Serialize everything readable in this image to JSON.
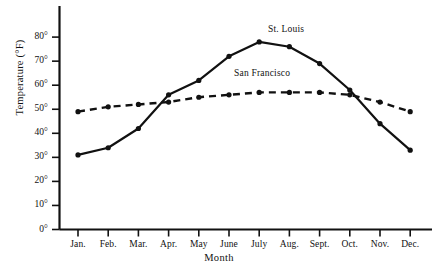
{
  "chart_data": {
    "type": "line",
    "title": "",
    "xlabel": "Month",
    "ylabel": "Temperature (°F)",
    "categories": [
      "Jan.",
      "Feb.",
      "Mar.",
      "Apr.",
      "May",
      "June",
      "July",
      "Aug.",
      "Sept.",
      "Oct.",
      "Nov.",
      "Dec."
    ],
    "ylim": [
      0,
      85
    ],
    "ytick_values": [
      0,
      10,
      20,
      30,
      40,
      50,
      60,
      70,
      80
    ],
    "ytick_labels": [
      "0°",
      "10°",
      "20°",
      "30°",
      "40°",
      "50°",
      "60°",
      "70°",
      "80°"
    ],
    "grid": false,
    "legend_position": "inline-annotation",
    "series": [
      {
        "name": "St. Louis",
        "style": "solid",
        "marker": "dot",
        "color": "#111111",
        "values": [
          31,
          34,
          42,
          56,
          62,
          72,
          78,
          76,
          69,
          58,
          44,
          33
        ]
      },
      {
        "name": "San Francisco",
        "style": "dashed",
        "marker": "dot",
        "color": "#111111",
        "values": [
          49,
          51,
          52,
          53,
          55,
          56,
          57,
          57,
          57,
          56,
          53,
          49
        ]
      }
    ]
  },
  "annotations": {
    "st_louis_label": "St. Louis",
    "san_francisco_label": "San Francisco"
  },
  "caption": {
    "text": ""
  }
}
